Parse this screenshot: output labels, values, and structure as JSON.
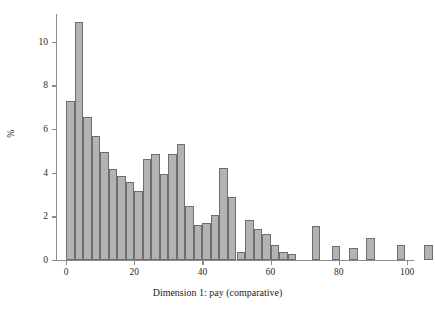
{
  "chart_data": {
    "type": "bar",
    "title": "",
    "subtitle": "",
    "xlabel": "Dimension 1: pay (comparative)",
    "ylabel": "%",
    "xlim": [
      -3,
      103
    ],
    "ylim": [
      0,
      11.4
    ],
    "grid": false,
    "legend": null,
    "bin_width": 2.5,
    "x_ticks": [
      0,
      20,
      40,
      60,
      80,
      100
    ],
    "x_tick_labels": [
      "0",
      "20",
      "40",
      "60",
      "80",
      "100"
    ],
    "y_ticks": [
      0,
      2,
      4,
      6,
      8,
      10
    ],
    "y_tick_labels": [
      "0",
      "2",
      "4",
      "6",
      "8",
      "10"
    ],
    "bin_starts": [
      0,
      2.5,
      5,
      7.5,
      10,
      12.5,
      15,
      17.5,
      20,
      22.5,
      25,
      27.5,
      30,
      32.5,
      35,
      37.5,
      40,
      42.5,
      45,
      47.5,
      50,
      52.5,
      55,
      57.5,
      65,
      70,
      75,
      80,
      90,
      97.5
    ],
    "values": [
      7.28,
      10.9,
      6.57,
      5.66,
      4.97,
      4.19,
      3.86,
      3.57,
      3.18,
      4.63,
      4.85,
      3.95,
      4.85,
      5.3,
      2.48,
      1.6,
      1.68,
      2.08,
      4.22,
      2.87,
      0.38,
      1.82,
      1.42,
      1.18,
      0.68,
      0.36,
      0.27,
      1.55,
      0.62,
      0.53,
      1.0,
      0.68,
      0.67
    ],
    "bars": [
      {
        "x0": 0,
        "x1": 2.5,
        "value": 7.28
      },
      {
        "x0": 2.5,
        "x1": 5,
        "value": 10.9
      },
      {
        "x0": 5,
        "x1": 7.5,
        "value": 6.57
      },
      {
        "x0": 7.5,
        "x1": 10,
        "value": 5.66
      },
      {
        "x0": 10,
        "x1": 12.5,
        "value": 4.97
      },
      {
        "x0": 12.5,
        "x1": 15,
        "value": 4.19
      },
      {
        "x0": 15,
        "x1": 17.5,
        "value": 3.86
      },
      {
        "x0": 17.5,
        "x1": 20,
        "value": 3.57
      },
      {
        "x0": 20,
        "x1": 22.5,
        "value": 3.18
      },
      {
        "x0": 22.5,
        "x1": 25,
        "value": 4.63
      },
      {
        "x0": 25,
        "x1": 27.5,
        "value": 4.85
      },
      {
        "x0": 27.5,
        "x1": 30,
        "value": 3.95
      },
      {
        "x0": 30,
        "x1": 32.5,
        "value": 4.85
      },
      {
        "x0": 32.5,
        "x1": 35,
        "value": 5.3
      },
      {
        "x0": 35,
        "x1": 37.5,
        "value": 2.48
      },
      {
        "x0": 37.5,
        "x1": 40,
        "value": 1.6
      },
      {
        "x0": 40,
        "x1": 42.5,
        "value": 1.68
      },
      {
        "x0": 42.5,
        "x1": 45,
        "value": 2.08
      },
      {
        "x0": 45,
        "x1": 47.5,
        "value": 4.22
      },
      {
        "x0": 47.5,
        "x1": 50,
        "value": 2.87
      },
      {
        "x0": 50,
        "x1": 52.5,
        "value": 0.38
      },
      {
        "x0": 52.5,
        "x1": 55,
        "value": 1.82
      },
      {
        "x0": 55,
        "x1": 57.5,
        "value": 1.42
      },
      {
        "x0": 57.5,
        "x1": 60,
        "value": 1.18
      },
      {
        "x0": 60,
        "x1": 62.5,
        "value": 0.68
      },
      {
        "x0": 62.5,
        "x1": 65,
        "value": 0.36
      },
      {
        "x0": 65,
        "x1": 67.5,
        "value": 0.27
      },
      {
        "x0": 72,
        "x1": 74.5,
        "value": 1.55
      },
      {
        "x0": 78,
        "x1": 80.5,
        "value": 0.62
      },
      {
        "x0": 83,
        "x1": 85.5,
        "value": 0.53
      },
      {
        "x0": 88,
        "x1": 90.5,
        "value": 1.0
      },
      {
        "x0": 97,
        "x1": 99.5,
        "value": 0.68
      },
      {
        "x0": 105,
        "x1": 107.5,
        "value": 0.67
      }
    ]
  },
  "style": {
    "bar_fill": "#b3b3b3",
    "bar_stroke": "#6e6e6e",
    "axis_color": "#8c8c8c",
    "text_color": "#1c1c1c",
    "background": "#ffffff"
  }
}
